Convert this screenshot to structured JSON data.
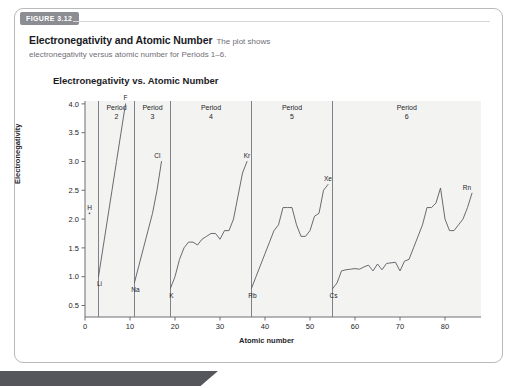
{
  "figure": {
    "tab_label": "FIGURE 3.12",
    "caption_title": "Electronegativity and Atomic Number",
    "caption_lead": "The plot shows",
    "caption_rest": "electronegativity versus atomic number for Periods 1–6."
  },
  "chart_data": {
    "type": "line",
    "title": "Electronegativity vs. Atomic Number",
    "xlabel": "Atomic number",
    "ylabel": "Electronegativity",
    "xlim": [
      0,
      88
    ],
    "ylim": [
      0.3,
      4.05
    ],
    "xticks": [
      0,
      10,
      20,
      30,
      40,
      50,
      60,
      70,
      80
    ],
    "yticks": [
      0.5,
      1.0,
      1.5,
      2.0,
      2.5,
      3.0,
      3.5,
      4.0
    ],
    "ytick_labels": [
      "0.5",
      "1.0",
      "1.5",
      "2.0",
      "2.5",
      "3.0",
      "3.5",
      "4.0"
    ],
    "xtick_labels": [
      "0",
      "10",
      "20",
      "30",
      "40",
      "50",
      "60",
      "70",
      "80"
    ],
    "grid": false,
    "legend": "none",
    "period_dividers": [
      3,
      11,
      19,
      37,
      55
    ],
    "period_bands": [
      {
        "label": "Period",
        "number": "2",
        "start": 3,
        "end": 11
      },
      {
        "label": "Period",
        "number": "3",
        "start": 11,
        "end": 19
      },
      {
        "label": "Period",
        "number": "4",
        "start": 19,
        "end": 37
      },
      {
        "label": "Period",
        "number": "5",
        "start": 37,
        "end": 55
      },
      {
        "label": "Period",
        "number": "6",
        "start": 55,
        "end": 88
      }
    ],
    "point_labels": [
      {
        "text": "H",
        "x": 1,
        "y": 2.1
      },
      {
        "text": "Li",
        "x": 3,
        "y": 1.0
      },
      {
        "text": "F",
        "x": 9,
        "y": 4.0
      },
      {
        "text": "Na",
        "x": 11,
        "y": 0.9
      },
      {
        "text": "Cl",
        "x": 17,
        "y": 3.0
      },
      {
        "text": "K",
        "x": 19,
        "y": 0.8
      },
      {
        "text": "Kr",
        "x": 36,
        "y": 3.0
      },
      {
        "text": "Rb",
        "x": 37,
        "y": 0.8
      },
      {
        "text": "Xe",
        "x": 54,
        "y": 2.6
      },
      {
        "text": "Cs",
        "x": 55,
        "y": 0.79
      },
      {
        "text": "Rn",
        "x": 86,
        "y": 2.45
      }
    ],
    "segments": [
      {
        "name": "Period 1",
        "points": [
          [
            1,
            2.1
          ]
        ]
      },
      {
        "name": "Period 2",
        "points": [
          [
            3,
            1.0
          ],
          [
            4,
            1.5
          ],
          [
            5,
            2.0
          ],
          [
            6,
            2.5
          ],
          [
            7,
            3.0
          ],
          [
            8,
            3.5
          ],
          [
            9,
            4.0
          ]
        ]
      },
      {
        "name": "Period 3",
        "points": [
          [
            11,
            0.9
          ],
          [
            12,
            1.2
          ],
          [
            13,
            1.5
          ],
          [
            14,
            1.8
          ],
          [
            15,
            2.1
          ],
          [
            16,
            2.5
          ],
          [
            17,
            3.0
          ]
        ]
      },
      {
        "name": "Period 4",
        "points": [
          [
            19,
            0.8
          ],
          [
            20,
            1.0
          ],
          [
            21,
            1.3
          ],
          [
            22,
            1.5
          ],
          [
            23,
            1.6
          ],
          [
            24,
            1.6
          ],
          [
            25,
            1.55
          ],
          [
            26,
            1.65
          ],
          [
            27,
            1.7
          ],
          [
            28,
            1.75
          ],
          [
            29,
            1.75
          ],
          [
            30,
            1.65
          ],
          [
            31,
            1.8
          ],
          [
            32,
            1.8
          ],
          [
            33,
            2.0
          ],
          [
            34,
            2.4
          ],
          [
            35,
            2.8
          ],
          [
            36,
            3.0
          ]
        ]
      },
      {
        "name": "Period 5",
        "points": [
          [
            37,
            0.8
          ],
          [
            38,
            1.0
          ],
          [
            39,
            1.2
          ],
          [
            40,
            1.4
          ],
          [
            41,
            1.6
          ],
          [
            42,
            1.8
          ],
          [
            43,
            1.9
          ],
          [
            44,
            2.2
          ],
          [
            45,
            2.2
          ],
          [
            46,
            2.2
          ],
          [
            47,
            1.9
          ],
          [
            48,
            1.7
          ],
          [
            49,
            1.7
          ],
          [
            50,
            1.8
          ],
          [
            51,
            2.05
          ],
          [
            52,
            2.1
          ],
          [
            53,
            2.5
          ],
          [
            54,
            2.6
          ]
        ]
      },
      {
        "name": "Period 6",
        "points": [
          [
            55,
            0.79
          ],
          [
            56,
            0.89
          ],
          [
            57,
            1.1
          ],
          [
            58,
            1.12
          ],
          [
            59,
            1.13
          ],
          [
            60,
            1.14
          ],
          [
            61,
            1.13
          ],
          [
            62,
            1.17
          ],
          [
            63,
            1.2
          ],
          [
            64,
            1.1
          ],
          [
            65,
            1.22
          ],
          [
            66,
            1.12
          ],
          [
            67,
            1.23
          ],
          [
            68,
            1.24
          ],
          [
            69,
            1.25
          ],
          [
            70,
            1.1
          ],
          [
            71,
            1.27
          ],
          [
            72,
            1.3
          ],
          [
            73,
            1.5
          ],
          [
            74,
            1.7
          ],
          [
            75,
            1.9
          ],
          [
            76,
            2.2
          ],
          [
            77,
            2.2
          ],
          [
            78,
            2.28
          ],
          [
            79,
            2.54
          ],
          [
            80,
            2.0
          ],
          [
            81,
            1.8
          ],
          [
            82,
            1.8
          ],
          [
            83,
            1.9
          ],
          [
            84,
            2.0
          ],
          [
            85,
            2.2
          ],
          [
            86,
            2.45
          ]
        ]
      }
    ]
  }
}
